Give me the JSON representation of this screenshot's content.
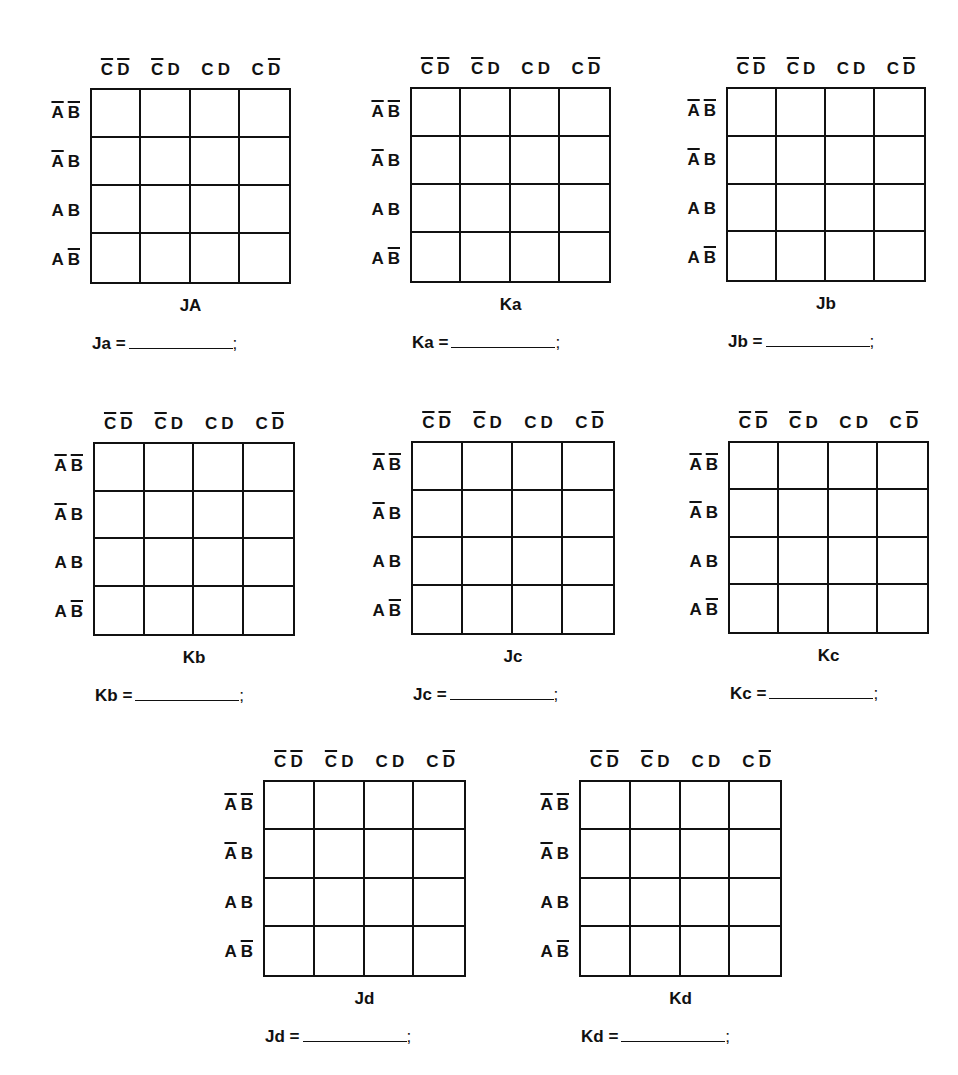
{
  "columns": [
    {
      "vars": [
        {
          "name": "C",
          "bar": true
        },
        {
          "name": "D",
          "bar": true
        }
      ]
    },
    {
      "vars": [
        {
          "name": "C",
          "bar": true
        },
        {
          "name": "D",
          "bar": false
        }
      ]
    },
    {
      "vars": [
        {
          "name": "C",
          "bar": false
        },
        {
          "name": "D",
          "bar": false
        }
      ]
    },
    {
      "vars": [
        {
          "name": "C",
          "bar": false
        },
        {
          "name": "D",
          "bar": true
        }
      ]
    }
  ],
  "rows": [
    {
      "vars": [
        {
          "name": "A",
          "bar": true
        },
        {
          "name": "B",
          "bar": true
        }
      ]
    },
    {
      "vars": [
        {
          "name": "A",
          "bar": true
        },
        {
          "name": "B",
          "bar": false
        }
      ]
    },
    {
      "vars": [
        {
          "name": "A",
          "bar": false
        },
        {
          "name": "B",
          "bar": false
        }
      ]
    },
    {
      "vars": [
        {
          "name": "A",
          "bar": false
        },
        {
          "name": "B",
          "bar": true
        }
      ]
    }
  ],
  "maps": [
    {
      "id": "ja",
      "title": "JA",
      "equation_label": "Ja =",
      "equation_value": "",
      "terminator": ";",
      "x": 90,
      "y": 88,
      "w": 201,
      "h": 196,
      "cells": [
        "",
        "",
        "",
        "",
        "",
        "",
        "",
        "",
        "",
        "",
        "",
        "",
        "",
        "",
        "",
        ""
      ]
    },
    {
      "id": "ka",
      "title": "Ka",
      "equation_label": "Ka =",
      "equation_value": "",
      "terminator": ";",
      "x": 410,
      "y": 87,
      "w": 201,
      "h": 196,
      "cells": [
        "",
        "",
        "",
        "",
        "",
        "",
        "",
        "",
        "",
        "",
        "",
        "",
        "",
        "",
        "",
        ""
      ]
    },
    {
      "id": "jb",
      "title": "Jb",
      "equation_label": "Jb =",
      "equation_value": "",
      "terminator": ";",
      "x": 726,
      "y": 87,
      "w": 200,
      "h": 195,
      "cells": [
        "",
        "",
        "",
        "",
        "",
        "",
        "",
        "",
        "",
        "",
        "",
        "",
        "",
        "",
        "",
        ""
      ]
    },
    {
      "id": "kb",
      "title": "Kb",
      "equation_label": "Kb =",
      "equation_value": "",
      "terminator": ";",
      "x": 93,
      "y": 442,
      "w": 202,
      "h": 194,
      "cells": [
        "",
        "",
        "",
        "",
        "",
        "",
        "",
        "",
        "",
        "",
        "",
        "",
        "",
        "",
        "",
        ""
      ]
    },
    {
      "id": "jc",
      "title": "Jc",
      "equation_label": "Jc =",
      "equation_value": "",
      "terminator": ";",
      "x": 411,
      "y": 441,
      "w": 204,
      "h": 194,
      "cells": [
        "",
        "",
        "",
        "",
        "",
        "",
        "",
        "",
        "",
        "",
        "",
        "",
        "",
        "",
        "",
        ""
      ]
    },
    {
      "id": "kc",
      "title": "Kc",
      "equation_label": "Kc =",
      "equation_value": "",
      "terminator": ";",
      "x": 728,
      "y": 441,
      "w": 201,
      "h": 193,
      "cells": [
        "",
        "",
        "",
        "",
        "",
        "",
        "",
        "",
        "",
        "",
        "",
        "",
        "",
        "",
        "",
        ""
      ]
    },
    {
      "id": "jd",
      "title": "Jd",
      "equation_label": "Jd =",
      "equation_value": "",
      "terminator": ";",
      "x": 263,
      "y": 780,
      "w": 203,
      "h": 197,
      "cells": [
        "",
        "",
        "",
        "",
        "",
        "",
        "",
        "",
        "",
        "",
        "",
        "",
        "",
        "",
        "",
        ""
      ]
    },
    {
      "id": "kd",
      "title": "Kd",
      "equation_label": "Kd =",
      "equation_value": "",
      "terminator": ";",
      "x": 579,
      "y": 780,
      "w": 203,
      "h": 197,
      "cells": [
        "",
        "",
        "",
        "",
        "",
        "",
        "",
        "",
        "",
        "",
        "",
        "",
        "",
        "",
        "",
        ""
      ]
    }
  ]
}
